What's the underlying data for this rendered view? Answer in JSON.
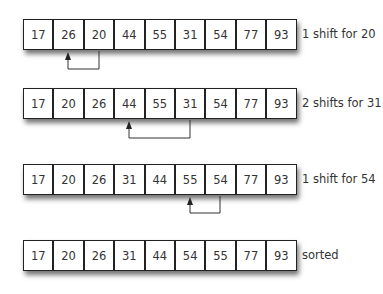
{
  "rows": [
    {
      "values": [
        "17",
        "26",
        "20",
        "44",
        "55",
        "31",
        "54",
        "77",
        "93"
      ],
      "label": "1 shift for 20",
      "arrow": {
        "from_index": 2,
        "to_index": 1
      }
    },
    {
      "values": [
        "17",
        "20",
        "26",
        "44",
        "55",
        "31",
        "54",
        "77",
        "93"
      ],
      "label": "2 shifts for 31",
      "arrow": {
        "from_index": 5,
        "to_index": 3
      }
    },
    {
      "values": [
        "17",
        "20",
        "26",
        "31",
        "44",
        "55",
        "54",
        "77",
        "93"
      ],
      "label": "1 shift for 54",
      "arrow": {
        "from_index": 6,
        "to_index": 5
      }
    },
    {
      "values": [
        "17",
        "20",
        "26",
        "31",
        "44",
        "54",
        "55",
        "77",
        "93"
      ],
      "label": "sorted"
    }
  ],
  "colors": {
    "border": "#222222",
    "text": "#333333",
    "arrow": "#333333"
  }
}
